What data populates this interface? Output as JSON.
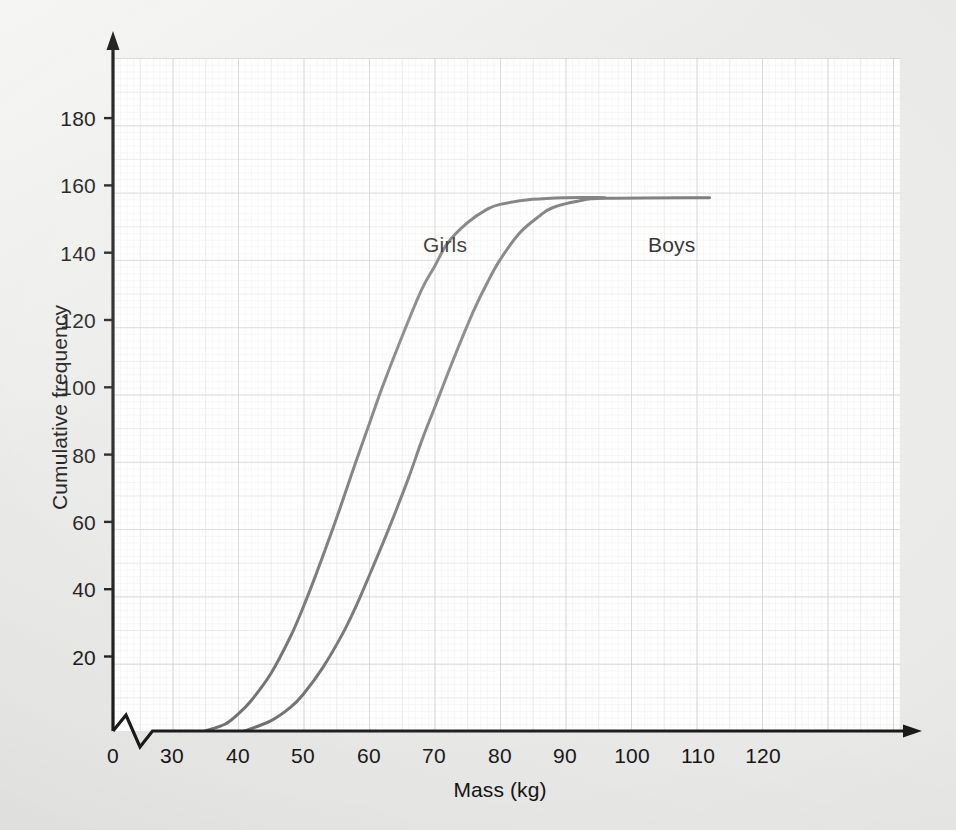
{
  "chart_data": {
    "type": "line",
    "title": "",
    "xlabel": "Mass (kg)",
    "ylabel": "Cumulative frequency",
    "xlim": [
      20,
      141
    ],
    "ylim": [
      0,
      196
    ],
    "x_axis_break": true,
    "x_break_from": 0,
    "x_break_to": 30,
    "grid": true,
    "grid_minor": true,
    "legend_position": "inline-annotation",
    "xticks": [
      0,
      30,
      40,
      50,
      60,
      70,
      80,
      90,
      100,
      110,
      120
    ],
    "xtick_labels": [
      "0",
      "30",
      "40",
      "50",
      "60",
      "70",
      "80",
      "90",
      "100",
      "110",
      "120"
    ],
    "yticks": [
      20,
      40,
      60,
      80,
      100,
      120,
      140,
      160,
      180
    ],
    "ytick_labels": [
      "20",
      "40",
      "60",
      "80",
      "100",
      "120",
      "140",
      "160",
      "180"
    ],
    "series": [
      {
        "name": "Girls",
        "color": "#6e6e6e",
        "label_x": 66,
        "label_y": 143,
        "points": [
          [
            35,
            0
          ],
          [
            38,
            2
          ],
          [
            40,
            5
          ],
          [
            42,
            9
          ],
          [
            45,
            17
          ],
          [
            48,
            28
          ],
          [
            50,
            37
          ],
          [
            52,
            47
          ],
          [
            55,
            63
          ],
          [
            58,
            80
          ],
          [
            60,
            91
          ],
          [
            62,
            102
          ],
          [
            65,
            117
          ],
          [
            68,
            131
          ],
          [
            70,
            138
          ],
          [
            72,
            145
          ],
          [
            75,
            151
          ],
          [
            78,
            155
          ],
          [
            80,
            156.5
          ],
          [
            85,
            158
          ],
          [
            90,
            158.5
          ],
          [
            96,
            158.5
          ]
        ]
      },
      {
        "name": "Boys",
        "color": "#6e6e6e",
        "label_x": 100,
        "label_y": 143,
        "points": [
          [
            41,
            0
          ],
          [
            45,
            3
          ],
          [
            48,
            7
          ],
          [
            50,
            11
          ],
          [
            53,
            19
          ],
          [
            56,
            29
          ],
          [
            58,
            37
          ],
          [
            60,
            46
          ],
          [
            63,
            60
          ],
          [
            66,
            75
          ],
          [
            68,
            86
          ],
          [
            70,
            96
          ],
          [
            73,
            111
          ],
          [
            76,
            125
          ],
          [
            78,
            133
          ],
          [
            80,
            140
          ],
          [
            83,
            148
          ],
          [
            86,
            153
          ],
          [
            88,
            155.5
          ],
          [
            92,
            157.5
          ],
          [
            96,
            158.3
          ],
          [
            112,
            158.5
          ]
        ]
      }
    ]
  },
  "axes": {
    "y_title": "Cumulative frequency",
    "x_title": "Mass (kg)",
    "origin_label": "0"
  },
  "colors": {
    "curve": "#6e6e6e",
    "axis": "#1a1a1a",
    "grid_major": "#c9c9c9",
    "grid_medium": "#dedede",
    "grid_minor": "#eeeeee",
    "paper": "#eaeae8",
    "plot_bg": "#ffffff"
  }
}
